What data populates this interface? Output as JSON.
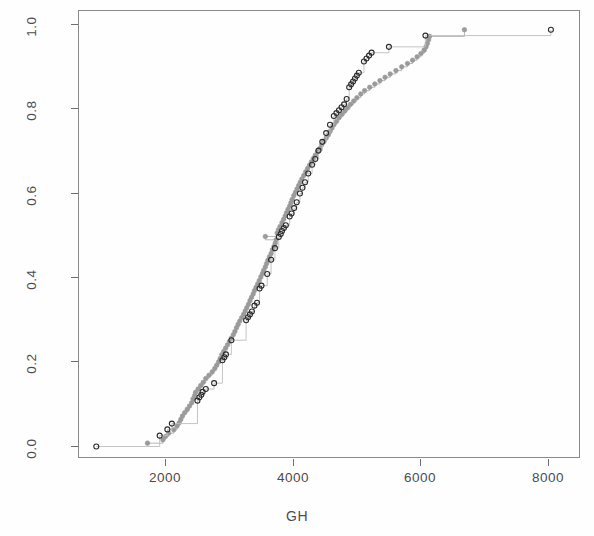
{
  "figure": {
    "background": "#fefefe",
    "frame_color": "#8a8a8a",
    "width": 594,
    "height": 536
  },
  "axis": {
    "x_title": "GH",
    "y_title": "",
    "x_ticks": [
      "2000",
      "4000",
      "6000",
      "8000"
    ],
    "y_ticks": [
      "0.0",
      "0.2",
      "0.4",
      "0.6",
      "0.8",
      "1.0"
    ]
  },
  "chart_data": {
    "type": "line",
    "title": "",
    "subtitle": "",
    "xlabel": "GH",
    "ylabel": "",
    "xlim": [
      780,
      8620
    ],
    "ylim": [
      -0.03,
      1.045
    ],
    "x_ticks": [
      2000,
      4000,
      6000,
      8000
    ],
    "y_ticks": [
      0.0,
      0.2,
      0.4,
      0.6,
      0.8,
      1.0
    ],
    "grid": false,
    "legend": "none",
    "series": [
      {
        "name": "grey-filled-ecdf",
        "marker": "filled-circle",
        "color": "#9a9a9a",
        "line_color": "#b0b0b0",
        "line_style": "step",
        "marker_size": 4.6,
        "points": [
          [
            1850,
            0.008
          ],
          [
            2090,
            0.016
          ],
          [
            2130,
            0.024
          ],
          [
            2180,
            0.032
          ],
          [
            2260,
            0.04
          ],
          [
            2310,
            0.049
          ],
          [
            2345,
            0.057
          ],
          [
            2370,
            0.065
          ],
          [
            2395,
            0.073
          ],
          [
            2430,
            0.081
          ],
          [
            2470,
            0.089
          ],
          [
            2505,
            0.097
          ],
          [
            2540,
            0.105
          ],
          [
            2560,
            0.114
          ],
          [
            2585,
            0.122
          ],
          [
            2600,
            0.13
          ],
          [
            2640,
            0.138
          ],
          [
            2680,
            0.146
          ],
          [
            2720,
            0.154
          ],
          [
            2760,
            0.163
          ],
          [
            2810,
            0.171
          ],
          [
            2860,
            0.179
          ],
          [
            2900,
            0.187
          ],
          [
            2930,
            0.195
          ],
          [
            2960,
            0.203
          ],
          [
            2985,
            0.211
          ],
          [
            3010,
            0.22
          ],
          [
            3040,
            0.228
          ],
          [
            3070,
            0.236
          ],
          [
            3100,
            0.244
          ],
          [
            3130,
            0.252
          ],
          [
            3160,
            0.26
          ],
          [
            3190,
            0.268
          ],
          [
            3215,
            0.276
          ],
          [
            3240,
            0.285
          ],
          [
            3265,
            0.293
          ],
          [
            3290,
            0.301
          ],
          [
            3320,
            0.309
          ],
          [
            3350,
            0.317
          ],
          [
            3375,
            0.325
          ],
          [
            3400,
            0.333
          ],
          [
            3425,
            0.341
          ],
          [
            3450,
            0.35
          ],
          [
            3475,
            0.358
          ],
          [
            3500,
            0.366
          ],
          [
            3520,
            0.374
          ],
          [
            3545,
            0.382
          ],
          [
            3570,
            0.39
          ],
          [
            3595,
            0.398
          ],
          [
            3620,
            0.407
          ],
          [
            3645,
            0.415
          ],
          [
            3665,
            0.423
          ],
          [
            3690,
            0.431
          ],
          [
            3710,
            0.439
          ],
          [
            3730,
            0.447
          ],
          [
            3755,
            0.455
          ],
          [
            3780,
            0.463
          ],
          [
            3800,
            0.472
          ],
          [
            3825,
            0.48
          ],
          [
            3845,
            0.488
          ],
          [
            3860,
            0.496
          ],
          [
            3690,
            0.504
          ],
          [
            3875,
            0.512
          ],
          [
            3895,
            0.52
          ],
          [
            3920,
            0.528
          ],
          [
            3950,
            0.537
          ],
          [
            3975,
            0.545
          ],
          [
            4000,
            0.553
          ],
          [
            4020,
            0.561
          ],
          [
            4045,
            0.569
          ],
          [
            4070,
            0.577
          ],
          [
            4090,
            0.585
          ],
          [
            4110,
            0.593
          ],
          [
            4135,
            0.602
          ],
          [
            4160,
            0.61
          ],
          [
            4185,
            0.618
          ],
          [
            4210,
            0.626
          ],
          [
            4235,
            0.634
          ],
          [
            4260,
            0.642
          ],
          [
            4290,
            0.65
          ],
          [
            4320,
            0.659
          ],
          [
            4350,
            0.667
          ],
          [
            4380,
            0.675
          ],
          [
            4410,
            0.683
          ],
          [
            4440,
            0.691
          ],
          [
            4470,
            0.699
          ],
          [
            4505,
            0.707
          ],
          [
            4540,
            0.715
          ],
          [
            4570,
            0.724
          ],
          [
            4605,
            0.732
          ],
          [
            4640,
            0.74
          ],
          [
            4675,
            0.748
          ],
          [
            4700,
            0.756
          ],
          [
            4730,
            0.764
          ],
          [
            4760,
            0.772
          ],
          [
            4800,
            0.78
          ],
          [
            4840,
            0.789
          ],
          [
            4885,
            0.797
          ],
          [
            4930,
            0.805
          ],
          [
            4975,
            0.813
          ],
          [
            5020,
            0.821
          ],
          [
            5070,
            0.829
          ],
          [
            5120,
            0.837
          ],
          [
            5180,
            0.846
          ],
          [
            5240,
            0.854
          ],
          [
            5320,
            0.862
          ],
          [
            5400,
            0.87
          ],
          [
            5480,
            0.878
          ],
          [
            5560,
            0.886
          ],
          [
            5640,
            0.894
          ],
          [
            5730,
            0.902
          ],
          [
            5820,
            0.911
          ],
          [
            5910,
            0.919
          ],
          [
            5990,
            0.927
          ],
          [
            6060,
            0.935
          ],
          [
            6120,
            0.943
          ],
          [
            6170,
            0.951
          ],
          [
            6200,
            0.959
          ],
          [
            6220,
            0.967
          ],
          [
            6240,
            0.976
          ],
          [
            6255,
            0.984
          ],
          [
            6800,
            1.0
          ]
        ]
      },
      {
        "name": "black-open-ecdf",
        "marker": "open-circle",
        "color": "#2b2b2b",
        "line_color": "#bdbdbd",
        "line_style": "step",
        "marker_size": 5.0,
        "points": [
          [
            1050,
            0.0
          ],
          [
            2040,
            0.026
          ],
          [
            2160,
            0.041
          ],
          [
            2230,
            0.055
          ],
          [
            2630,
            0.11
          ],
          [
            2660,
            0.118
          ],
          [
            2690,
            0.124
          ],
          [
            2710,
            0.131
          ],
          [
            2760,
            0.138
          ],
          [
            2890,
            0.152
          ],
          [
            3020,
            0.207
          ],
          [
            3050,
            0.214
          ],
          [
            3075,
            0.221
          ],
          [
            3160,
            0.255
          ],
          [
            3390,
            0.303
          ],
          [
            3420,
            0.31
          ],
          [
            3450,
            0.317
          ],
          [
            3480,
            0.324
          ],
          [
            3520,
            0.338
          ],
          [
            3560,
            0.345
          ],
          [
            3600,
            0.379
          ],
          [
            3630,
            0.386
          ],
          [
            3720,
            0.414
          ],
          [
            3780,
            0.448
          ],
          [
            3840,
            0.476
          ],
          [
            3900,
            0.503
          ],
          [
            3930,
            0.51
          ],
          [
            3950,
            0.517
          ],
          [
            3980,
            0.524
          ],
          [
            4010,
            0.531
          ],
          [
            4070,
            0.552
          ],
          [
            4100,
            0.559
          ],
          [
            4140,
            0.572
          ],
          [
            4180,
            0.586
          ],
          [
            4230,
            0.607
          ],
          [
            4270,
            0.621
          ],
          [
            4310,
            0.634
          ],
          [
            4360,
            0.655
          ],
          [
            4420,
            0.676
          ],
          [
            4470,
            0.69
          ],
          [
            4520,
            0.71
          ],
          [
            4580,
            0.731
          ],
          [
            4640,
            0.752
          ],
          [
            4700,
            0.772
          ],
          [
            4760,
            0.793
          ],
          [
            4800,
            0.8
          ],
          [
            4840,
            0.807
          ],
          [
            4880,
            0.814
          ],
          [
            4920,
            0.821
          ],
          [
            4960,
            0.834
          ],
          [
            5000,
            0.862
          ],
          [
            5030,
            0.869
          ],
          [
            5060,
            0.876
          ],
          [
            5090,
            0.883
          ],
          [
            5120,
            0.89
          ],
          [
            5150,
            0.897
          ],
          [
            5230,
            0.924
          ],
          [
            5270,
            0.931
          ],
          [
            5310,
            0.938
          ],
          [
            5350,
            0.945
          ],
          [
            5620,
            0.959
          ],
          [
            6190,
            0.986
          ],
          [
            8150,
            1.0
          ]
        ]
      }
    ]
  }
}
